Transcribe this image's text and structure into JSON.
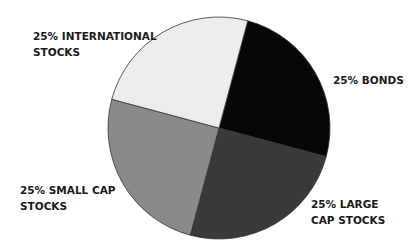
{
  "chart_data": {
    "type": "pie",
    "title": "",
    "categories": [
      "International Stocks",
      "Bonds",
      "Large Cap Stocks",
      "Small Cap Stocks"
    ],
    "values": [
      25,
      25,
      25,
      25
    ],
    "colors": [
      "#070707",
      "#3a3a3a",
      "#8a8a8a",
      "#ececec"
    ],
    "labels": [
      {
        "line1": "25% INTERNATIONAL",
        "line2": "STOCKS"
      },
      {
        "line1": "25% BONDS",
        "line2": ""
      },
      {
        "line1": "25% LARGE",
        "line2": "CAP STOCKS"
      },
      {
        "line1": "25% SMALL CAP",
        "line2": "STOCKS"
      }
    ],
    "start_angle_deg": -75,
    "legend": "none (direct labels)",
    "center": [
      219,
      128
    ],
    "radius": 111
  }
}
